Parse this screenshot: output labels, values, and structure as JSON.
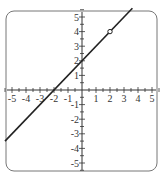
{
  "chart_data": {
    "type": "line",
    "title": "",
    "xlabel": "",
    "ylabel": "",
    "xlim": [
      -5.5,
      5.5
    ],
    "ylim": [
      -5.5,
      5.5
    ],
    "x_ticks": [
      -5,
      -4,
      -3,
      -2,
      -1,
      1,
      2,
      3,
      4,
      5
    ],
    "y_ticks": [
      5,
      4,
      3,
      2,
      1,
      -1,
      -2,
      -3,
      -4,
      -5
    ],
    "grid": false,
    "series": [
      {
        "name": "y = x + 2",
        "equation": "y = x + 2",
        "slope": 1,
        "intercept": 2,
        "x": [
          -5.5,
          3.6
        ],
        "y": [
          -3.5,
          5.6
        ]
      }
    ],
    "annotations": [
      {
        "type": "open-circle",
        "x": 2,
        "y": 4
      }
    ],
    "colors": {
      "line": "#222222",
      "axis": "#333333",
      "frame": "#666666"
    }
  }
}
